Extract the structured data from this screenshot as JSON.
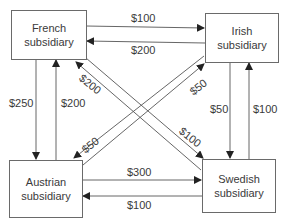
{
  "diagram": {
    "type": "intercompany-payments-flow",
    "nodes": {
      "french": {
        "line1": "French",
        "line2": "subsidiary"
      },
      "irish": {
        "line1": "Irish",
        "line2": "subsidiary"
      },
      "austrian": {
        "line1": "Austrian",
        "line2": "subsidiary"
      },
      "swedish": {
        "line1": "Swedish",
        "line2": "subsidiary"
      }
    },
    "flows": {
      "french_to_irish": "$100",
      "irish_to_french": "$200",
      "french_to_austrian": "$250",
      "austrian_to_french": "$200",
      "swedish_to_french": "$200",
      "french_to_swedish": "$100",
      "austrian_to_irish": "$50",
      "irish_to_austrian": "$50",
      "irish_to_swedish": "$50",
      "swedish_to_irish": "$100",
      "austrian_to_swedish": "$300",
      "swedish_to_austrian": "$100"
    },
    "colors": {
      "line": "#555555",
      "text": "#3a3a3a",
      "border": "#6a6a6a"
    }
  }
}
